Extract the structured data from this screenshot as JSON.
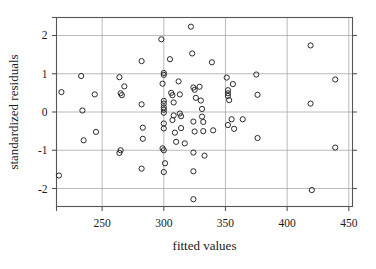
{
  "chart_data": {
    "type": "scatter",
    "title": "",
    "xlabel": "fitted values",
    "ylabel": "standardized residuals",
    "xlim": [
      213,
      453
    ],
    "ylim": [
      -2.47,
      2.47
    ],
    "xticks": [
      250,
      300,
      350,
      400,
      450
    ],
    "xtick_labels": [
      "250",
      "300",
      "350",
      "400",
      "450"
    ],
    "yticks": [
      2,
      1,
      0,
      -1,
      -2
    ],
    "ytick_labels": [
      "2",
      "1",
      "0",
      "-1",
      "-2"
    ],
    "grid": true,
    "legend": "none",
    "marker": "open-circle",
    "marker_color": "#2b2b2b",
    "points": [
      [
        217,
        0.52
      ],
      [
        215,
        -1.66
      ],
      [
        233,
        0.94
      ],
      [
        234,
        0.04
      ],
      [
        235,
        -0.74
      ],
      [
        244,
        0.46
      ],
      [
        245,
        -0.52
      ],
      [
        264,
        0.91
      ],
      [
        265,
        0.49
      ],
      [
        266,
        0.44
      ],
      [
        265,
        -1.0
      ],
      [
        264,
        -1.07
      ],
      [
        268,
        0.67
      ],
      [
        282,
        1.33
      ],
      [
        282,
        0.2
      ],
      [
        283,
        -0.41
      ],
      [
        283,
        -0.7
      ],
      [
        282,
        -1.48
      ],
      [
        298,
        1.9
      ],
      [
        299,
        0.74
      ],
      [
        300,
        1.02
      ],
      [
        300,
        0.97
      ],
      [
        300,
        0.29
      ],
      [
        300,
        0.22
      ],
      [
        300,
        0.12
      ],
      [
        300,
        0.06
      ],
      [
        300,
        -0.02
      ],
      [
        300,
        -0.3
      ],
      [
        300,
        -0.43
      ],
      [
        299,
        -0.95
      ],
      [
        300,
        -1.0
      ],
      [
        301,
        -1.34
      ],
      [
        300,
        -1.57
      ],
      [
        305,
        1.38
      ],
      [
        306,
        0.5
      ],
      [
        307,
        0.44
      ],
      [
        308,
        0.25
      ],
      [
        307,
        -0.21
      ],
      [
        308,
        -0.09
      ],
      [
        309,
        -0.54
      ],
      [
        310,
        -0.78
      ],
      [
        312,
        0.8
      ],
      [
        313,
        0.46
      ],
      [
        313,
        -0.04
      ],
      [
        314,
        -0.11
      ],
      [
        314,
        -0.42
      ],
      [
        317,
        -0.82
      ],
      [
        322,
        2.23
      ],
      [
        323,
        1.53
      ],
      [
        324,
        0.64
      ],
      [
        325,
        0.58
      ],
      [
        326,
        0.37
      ],
      [
        324,
        -0.25
      ],
      [
        325,
        -0.51
      ],
      [
        324,
        -1.06
      ],
      [
        324,
        -1.55
      ],
      [
        324,
        -2.28
      ],
      [
        329,
        0.66
      ],
      [
        330,
        0.3
      ],
      [
        331,
        0.08
      ],
      [
        331,
        -0.12
      ],
      [
        332,
        -0.26
      ],
      [
        332,
        -0.5
      ],
      [
        333,
        -1.14
      ],
      [
        339,
        1.3
      ],
      [
        340,
        -0.48
      ],
      [
        351,
        0.9
      ],
      [
        352,
        0.57
      ],
      [
        352,
        0.49
      ],
      [
        352,
        0.42
      ],
      [
        353,
        0.31
      ],
      [
        352,
        -0.34
      ],
      [
        355,
        -0.19
      ],
      [
        356,
        0.73
      ],
      [
        357,
        -0.44
      ],
      [
        364,
        -0.19
      ],
      [
        375,
        0.98
      ],
      [
        376,
        0.45
      ],
      [
        376,
        -0.68
      ],
      [
        419,
        1.74
      ],
      [
        419,
        0.22
      ],
      [
        420,
        -2.04
      ],
      [
        439,
        0.85
      ],
      [
        439,
        -0.93
      ]
    ]
  }
}
